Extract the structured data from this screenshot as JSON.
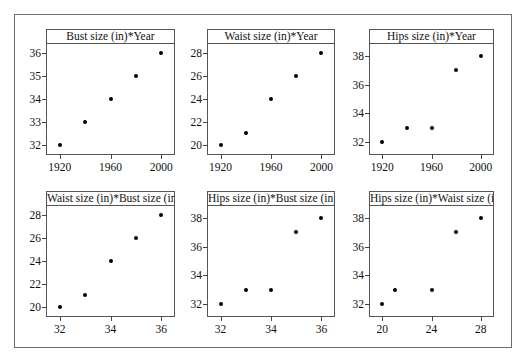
{
  "figure": {
    "background": "#ffffff",
    "frame_color": "#6e6e6e",
    "marker_color": "#000000",
    "rows": 2,
    "cols": 3
  },
  "chart_data": [
    {
      "type": "scatter",
      "title": "Bust size (in)*Year",
      "xlabel": "",
      "ylabel": "",
      "x": [
        1920,
        1940,
        1960,
        1980,
        2000
      ],
      "y": [
        32,
        33,
        34,
        35,
        36
      ],
      "xticks": [
        1920,
        1960,
        2000
      ],
      "xticklabels": [
        "1920",
        "1960",
        "2000"
      ],
      "yticks": [
        32,
        33,
        34,
        35,
        36
      ],
      "yticklabels": [
        "32",
        "33",
        "34",
        "35",
        "36"
      ],
      "xlim": [
        1910,
        2010
      ],
      "ylim": [
        31.6,
        36.4
      ],
      "grid": false,
      "legend": "none"
    },
    {
      "type": "scatter",
      "title": "Waist size (in)*Year",
      "xlabel": "",
      "ylabel": "",
      "x": [
        1920,
        1940,
        1960,
        1980,
        2000
      ],
      "y": [
        20,
        21,
        24,
        26,
        28
      ],
      "xticks": [
        1920,
        1960,
        2000
      ],
      "xticklabels": [
        "1920",
        "1960",
        "2000"
      ],
      "yticks": [
        20,
        22,
        24,
        26,
        28
      ],
      "yticklabels": [
        "20",
        "22",
        "24",
        "26",
        "28"
      ],
      "xlim": [
        1910,
        2010
      ],
      "ylim": [
        19.2,
        28.8
      ],
      "grid": false,
      "legend": "none"
    },
    {
      "type": "scatter",
      "title": "Hips size (in)*Year",
      "xlabel": "",
      "ylabel": "",
      "x": [
        1920,
        1940,
        1960,
        1980,
        2000
      ],
      "y": [
        32,
        33,
        33,
        37,
        38
      ],
      "xticks": [
        1920,
        1960,
        2000
      ],
      "xticklabels": [
        "1920",
        "1960",
        "2000"
      ],
      "yticks": [
        32,
        34,
        36,
        38
      ],
      "yticklabels": [
        "32",
        "34",
        "36",
        "38"
      ],
      "xlim": [
        1910,
        2010
      ],
      "ylim": [
        31.2,
        38.8
      ],
      "grid": false,
      "legend": "none"
    },
    {
      "type": "scatter",
      "title": "Waist size (in)*Bust size (in)",
      "xlabel": "",
      "ylabel": "",
      "x": [
        32,
        33,
        34,
        35,
        36
      ],
      "y": [
        20,
        21,
        24,
        26,
        28
      ],
      "xticks": [
        32,
        34,
        36
      ],
      "xticklabels": [
        "32",
        "34",
        "36"
      ],
      "yticks": [
        20,
        22,
        24,
        26,
        28
      ],
      "yticklabels": [
        "20",
        "22",
        "24",
        "26",
        "28"
      ],
      "xlim": [
        31.5,
        36.5
      ],
      "ylim": [
        19.2,
        28.8
      ],
      "grid": false,
      "legend": "none"
    },
    {
      "type": "scatter",
      "title": "Hips size (in)*Bust size (in)",
      "xlabel": "",
      "ylabel": "",
      "x": [
        32,
        33,
        34,
        35,
        36
      ],
      "y": [
        32,
        33,
        33,
        37,
        38
      ],
      "xticks": [
        32,
        34,
        36
      ],
      "xticklabels": [
        "32",
        "34",
        "36"
      ],
      "yticks": [
        32,
        34,
        36,
        38
      ],
      "yticklabels": [
        "32",
        "34",
        "36",
        "38"
      ],
      "xlim": [
        31.5,
        36.5
      ],
      "ylim": [
        31.2,
        38.8
      ],
      "grid": false,
      "legend": "none"
    },
    {
      "type": "scatter",
      "title": "Hips size (in)*Waist size (in)",
      "xlabel": "",
      "ylabel": "",
      "x": [
        20,
        21,
        24,
        26,
        28
      ],
      "y": [
        32,
        33,
        33,
        37,
        38
      ],
      "xticks": [
        20,
        24,
        28
      ],
      "xticklabels": [
        "20",
        "24",
        "28"
      ],
      "yticks": [
        32,
        34,
        36,
        38
      ],
      "yticklabels": [
        "32",
        "34",
        "36",
        "38"
      ],
      "xlim": [
        19,
        29
      ],
      "ylim": [
        31.2,
        38.8
      ],
      "grid": false,
      "legend": "none"
    }
  ],
  "layout": {
    "panels": [
      {
        "left": 46,
        "top": 29,
        "width": 129,
        "height": 126
      },
      {
        "left": 207,
        "top": 29,
        "width": 128,
        "height": 126
      },
      {
        "left": 369,
        "top": 29,
        "width": 125,
        "height": 126
      },
      {
        "left": 46,
        "top": 191,
        "width": 129,
        "height": 126
      },
      {
        "left": 207,
        "top": 191,
        "width": 128,
        "height": 126
      },
      {
        "left": 369,
        "top": 191,
        "width": 125,
        "height": 126
      }
    ]
  }
}
